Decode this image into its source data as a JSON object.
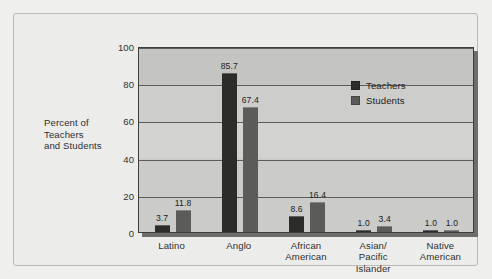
{
  "chart_data": {
    "type": "bar",
    "title": "",
    "subtitle": "",
    "xlabel": "",
    "ylabel": "Percent of Teachers and Students",
    "ylabel_lines": [
      "Percent of",
      "Teachers",
      "and Students"
    ],
    "ylim": [
      0,
      100
    ],
    "yticks": [
      0,
      20,
      40,
      60,
      80,
      100
    ],
    "ytick_labels": [
      "0",
      "20",
      "40",
      "60",
      "80",
      "100"
    ],
    "grid": true,
    "legend_position": "inside-top-center",
    "categories": [
      "Latino",
      "Anglo",
      "African American",
      "Asian/ Pacific Islander",
      "Native American"
    ],
    "category_lines": [
      [
        "Latino"
      ],
      [
        "Anglo"
      ],
      [
        "African",
        "American"
      ],
      [
        "Asian/",
        "Pacific",
        "Islander"
      ],
      [
        "Native",
        "American"
      ]
    ],
    "series": [
      {
        "name": "Teachers",
        "color": "#2c2c2a",
        "values": [
          3.7,
          85.7,
          8.6,
          1.0,
          1.0
        ],
        "value_labels": [
          "3.7",
          "85.7",
          "8.6",
          "1.0",
          "1.0"
        ]
      },
      {
        "name": "Students",
        "color": "#5b5b59",
        "values": [
          11.8,
          67.4,
          16.4,
          3.4,
          1.0
        ],
        "value_labels": [
          "11.8",
          "67.4",
          "16.4",
          "3.4",
          "1.0"
        ]
      }
    ]
  },
  "legend": {
    "items": [
      {
        "label": "Teachers",
        "color": "#2c2c2a"
      },
      {
        "label": "Students",
        "color": "#5b5b59"
      }
    ]
  },
  "colors": {
    "plot_background": "#d3d3d1",
    "page_background": "#efefed",
    "frame_background": "#ececeb",
    "axis_line": "#3e3e3c",
    "gridline": "#5d5d5b",
    "text": "#2f2f2f",
    "teachers": "#2c2c2a",
    "students": "#5b5b59"
  }
}
